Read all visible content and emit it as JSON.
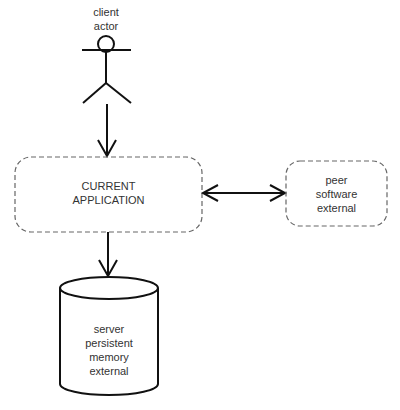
{
  "diagram": {
    "actor": {
      "lines": [
        "client",
        "actor"
      ]
    },
    "current_app": {
      "lines": [
        "CURRENT",
        "APPLICATION"
      ],
      "style": "dashed-rounded"
    },
    "peer": {
      "lines": [
        "peer",
        "software",
        "external"
      ],
      "style": "dashed-rounded"
    },
    "server": {
      "lines": [
        "server",
        "persistent",
        "memory",
        "external"
      ],
      "shape": "cylinder"
    },
    "edges": [
      {
        "from": "client actor",
        "to": "CURRENT APPLICATION",
        "direction": "forward"
      },
      {
        "from": "CURRENT APPLICATION",
        "to": "peer software external",
        "direction": "bidirectional"
      },
      {
        "from": "CURRENT APPLICATION",
        "to": "server persistent memory external",
        "direction": "forward"
      }
    ],
    "colors": {
      "stroke": "#111111",
      "dashed": "#666666",
      "text": "#333333",
      "background": "#ffffff"
    }
  }
}
